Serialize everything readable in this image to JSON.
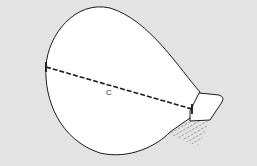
{
  "diagram": {
    "measurement_label": "C",
    "colors": {
      "background": "#e3e3e3",
      "shape_fill": "#ffffff",
      "outline": "#1a1a1a",
      "hatch": "#555555"
    }
  }
}
